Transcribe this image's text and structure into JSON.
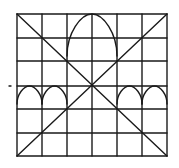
{
  "diagram": {
    "grid": {
      "columns": 6,
      "rows": 6,
      "x_lines": [
        17,
        42,
        67,
        92,
        117,
        142,
        167
      ],
      "y_lines": [
        14,
        38,
        61,
        86,
        109,
        133,
        156
      ]
    },
    "diagonals": [
      {
        "from": [
          17,
          14
        ],
        "to": [
          167,
          156
        ]
      },
      {
        "from": [
          167,
          14
        ],
        "to": [
          17,
          156
        ]
      }
    ],
    "arches": [
      {
        "name": "large-central-arch",
        "left": 67,
        "right": 117,
        "spring_y": 56,
        "apex": [
          92,
          14
        ]
      },
      {
        "name": "small-arch-1",
        "left": 17,
        "right": 42,
        "spring_y": 104,
        "apex": [
          29.5,
          86
        ]
      },
      {
        "name": "small-arch-2",
        "left": 42,
        "right": 67,
        "spring_y": 104,
        "apex": [
          54.5,
          86
        ]
      },
      {
        "name": "small-arch-3",
        "left": 117,
        "right": 142,
        "spring_y": 104,
        "apex": [
          129.5,
          86
        ]
      },
      {
        "name": "small-arch-4",
        "left": 142,
        "right": 167,
        "spring_y": 104,
        "apex": [
          154.5,
          86
        ]
      }
    ],
    "stray_mark": {
      "x": 10,
      "y": 86
    },
    "colors": {
      "ink": "#1a1a1a",
      "paper": "#ffffff"
    }
  }
}
